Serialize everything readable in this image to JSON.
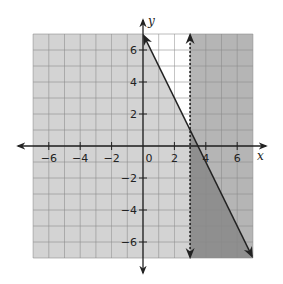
{
  "chart_data": {
    "type": "inequality-graph",
    "title": "",
    "xlabel": "x",
    "ylabel": "y",
    "xlim": [
      -7,
      7
    ],
    "ylim": [
      -7,
      7
    ],
    "grid": true,
    "grid_step": 1,
    "x_ticks": [
      -6,
      -4,
      -2,
      0,
      2,
      4,
      6
    ],
    "x_tick_labels": [
      "−6",
      "−4",
      "−2",
      "0",
      "2",
      "4",
      "6"
    ],
    "y_ticks": [
      6,
      4,
      2,
      -2,
      -4,
      -6
    ],
    "y_tick_labels": [
      "6",
      "4",
      "2",
      "−2",
      "−4",
      "−6"
    ],
    "boundaries": [
      {
        "name": "solid-line",
        "equation": "y = -2x + 7",
        "style": "solid",
        "points": [
          [
            0,
            7
          ],
          [
            7,
            -7
          ]
        ]
      },
      {
        "name": "dashed-line",
        "equation": "x = 3",
        "style": "dashed",
        "points": [
          [
            3,
            7
          ],
          [
            3,
            -7
          ]
        ]
      }
    ],
    "shaded_regions": [
      {
        "name": "below-line",
        "inequality": "y ≤ -2x + 7",
        "color": "#d3d3d3"
      },
      {
        "name": "right-of-dashed",
        "inequality": "x > 3",
        "color": "#b5b5b5"
      },
      {
        "name": "overlap",
        "inequality": "y ≤ -2x + 7 and x > 3",
        "color": "#8f8f8f"
      }
    ]
  },
  "colors": {
    "white_region": "#ffffff",
    "light_region": "#d3d3d3",
    "medium_region": "#b5b5b5",
    "dark_region": "#8f8f8f",
    "grid": "#8c8c8c",
    "axis": "#222222"
  }
}
